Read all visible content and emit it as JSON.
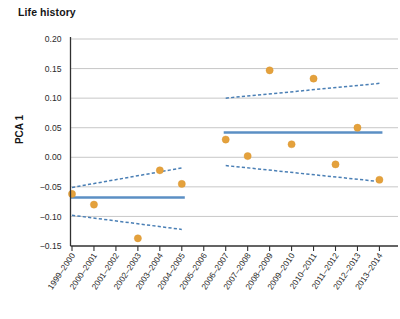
{
  "chart_data": {
    "type": "scatter",
    "title": "Life history",
    "xlabel": "",
    "ylabel": "PCA 1",
    "ylim": [
      -0.15,
      0.2
    ],
    "ytick_labels": [
      "0.20",
      "0.15",
      "0.10",
      "0.05",
      "0.00",
      "−0.05",
      "−0.10",
      "−0.15"
    ],
    "ytick_values": [
      0.2,
      0.15,
      0.1,
      0.05,
      0.0,
      -0.05,
      -0.1,
      -0.15
    ],
    "grid": true,
    "legend": "none",
    "categories": [
      "1999–2000",
      "2000–2001",
      "2001–2002",
      "2002–2003",
      "2003–2004",
      "2004–2005",
      "2005–2006",
      "2006–2007",
      "2007–2008",
      "2008–2009",
      "2009–2010",
      "2010–2011",
      "2011–2012",
      "2012–2013",
      "2013–2014"
    ],
    "series": [
      {
        "name": "PCA 1 annual score",
        "marker": "circle",
        "color": "#e4a13c",
        "values": [
          -0.062,
          -0.08,
          null,
          -0.137,
          -0.022,
          -0.045,
          null,
          0.03,
          0.002,
          0.147,
          0.022,
          0.133,
          -0.012,
          0.05,
          -0.038
        ]
      }
    ],
    "segments": [
      {
        "name": "regime-1",
        "label": "1999–2000 to 2004–2005",
        "color": "#5b8fc4",
        "x_start_index": 0,
        "x_end_index": 5,
        "mean": -0.068,
        "ci_upper_start": -0.051,
        "ci_upper_end": -0.018,
        "ci_lower_start": -0.098,
        "ci_lower_end": -0.122
      },
      {
        "name": "regime-2",
        "label": "2006–2007 to 2013–2014",
        "color": "#5b8fc4",
        "x_start_index": 7,
        "x_end_index": 14,
        "mean": 0.042,
        "ci_upper_start": 0.1,
        "ci_upper_end": 0.125,
        "ci_lower_start": -0.014,
        "ci_lower_end": -0.041
      }
    ]
  },
  "colors": {
    "point": "#e4a13c",
    "trend": "#5b8fc4",
    "grid": "#b9b9b9",
    "axis": "#303030",
    "background": "#ffffff"
  }
}
